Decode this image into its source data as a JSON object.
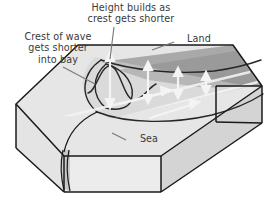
{
  "diagram": {
    "title_label": "Height builds as\ncrest gets shorter",
    "crest_label": "Crest of wave\ngets shorter\ninto bay",
    "land_label": "Land",
    "sea_label": "Sea",
    "labels": [
      {
        "name": "height-builds-label",
        "text": "Height builds as\ncrest gets shorter"
      },
      {
        "name": "crest-of-wave-label",
        "text": "Crest of wave\ngets shorter\ninto bay"
      },
      {
        "name": "land-label",
        "text": "Land"
      },
      {
        "name": "sea-label",
        "text": "Sea"
      }
    ],
    "colors": {
      "outline": "#1a1a1a",
      "text": "#3a3a3a",
      "sea_top_face": "#e3e3e3",
      "land_top_face": "#a9a9a9",
      "land_top_face_dark": "#8f8f8f",
      "front_face": "#e8e8e8",
      "side_face": "#d2d2d2",
      "right_panel": "#cfcfcf",
      "wave_line": "#2b2b2b",
      "arrow": "#efefef",
      "leader": "#6e6e6e",
      "background": "#ffffff"
    },
    "elements": {
      "block": "isometric-rectangular-block",
      "bay": "funnel-shaped-bay-notch",
      "wave_crests": "three-curved-crest-lines-shortening-into-bay",
      "wave_profile": "sinusoidal-height-profile",
      "arrows": "white-double-headed-height-arrows",
      "crest_band": "vertical-wave-crest-band-on-front-face"
    }
  }
}
